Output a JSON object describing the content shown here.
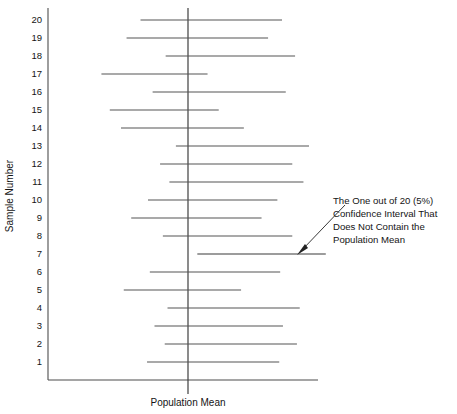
{
  "figure": {
    "type": "confidence-interval-plot",
    "background": "#ffffff",
    "line_color": "#555555",
    "axis_color": "#4d4d4d"
  },
  "axes": {
    "y_title": "Sample Number",
    "x_title": "Population Mean",
    "y_tick_labels": [
      "20",
      "19",
      "18",
      "17",
      "16",
      "15",
      "14",
      "13",
      "12",
      "11",
      "10",
      "9",
      "8",
      "7",
      "6",
      "5",
      "4",
      "3",
      "2",
      "1"
    ]
  },
  "annotation": {
    "lines": [
      "The One out of 20 (5%)",
      "Confidence Interval That",
      "Does Not Contain the",
      "Population Mean"
    ],
    "line_1": "The One out of 20 (5%)",
    "line_2": "Confidence Interval That",
    "line_3": "Does Not Contain the",
    "line_4": "Population Mean",
    "points_to_sample": 7
  },
  "chart_data": {
    "type": "line",
    "title": "",
    "xlabel": "Population Mean",
    "ylabel": "Sample Number",
    "grid": false,
    "legend": "none",
    "population_mean": 0,
    "confidence_level": "95%",
    "note": "Each horizontal segment is one sample's 95% confidence interval; the vertical line marks the true population mean. Sample 7 is the only interval that excludes the mean.",
    "categories": [
      "1",
      "2",
      "3",
      "4",
      "5",
      "6",
      "7",
      "8",
      "9",
      "10",
      "11",
      "12",
      "13",
      "14",
      "15",
      "16",
      "17",
      "18",
      "19",
      "20"
    ],
    "intervals": [
      {
        "sample": 20,
        "low": -0.51,
        "high": 1.01,
        "contains_mean": true
      },
      {
        "sample": 19,
        "low": -0.66,
        "high": 0.86,
        "contains_mean": true
      },
      {
        "sample": 18,
        "low": -0.24,
        "high": 1.15,
        "contains_mean": true
      },
      {
        "sample": 17,
        "low": -0.93,
        "high": 0.21,
        "contains_mean": true
      },
      {
        "sample": 16,
        "low": -0.38,
        "high": 1.05,
        "contains_mean": true
      },
      {
        "sample": 15,
        "low": -0.84,
        "high": 0.33,
        "contains_mean": true
      },
      {
        "sample": 14,
        "low": -0.72,
        "high": 0.6,
        "contains_mean": true
      },
      {
        "sample": 13,
        "low": -0.13,
        "high": 1.3,
        "contains_mean": true
      },
      {
        "sample": 12,
        "low": -0.3,
        "high": 1.12,
        "contains_mean": true
      },
      {
        "sample": 11,
        "low": -0.2,
        "high": 1.24,
        "contains_mean": true
      },
      {
        "sample": 10,
        "low": -0.43,
        "high": 0.96,
        "contains_mean": true
      },
      {
        "sample": 9,
        "low": -0.61,
        "high": 0.79,
        "contains_mean": true
      },
      {
        "sample": 8,
        "low": -0.27,
        "high": 1.12,
        "contains_mean": true
      },
      {
        "sample": 7,
        "low": 0.1,
        "high": 1.48,
        "contains_mean": false
      },
      {
        "sample": 6,
        "low": -0.41,
        "high": 0.99,
        "contains_mean": true
      },
      {
        "sample": 5,
        "low": -0.69,
        "high": 0.57,
        "contains_mean": true
      },
      {
        "sample": 4,
        "low": -0.22,
        "high": 1.2,
        "contains_mean": true
      },
      {
        "sample": 3,
        "low": -0.36,
        "high": 1.02,
        "contains_mean": true
      },
      {
        "sample": 2,
        "low": -0.25,
        "high": 1.17,
        "contains_mean": true
      },
      {
        "sample": 1,
        "low": -0.44,
        "high": 0.98,
        "contains_mean": true
      }
    ],
    "x_axis_range": [
      -1.15,
      1.75
    ],
    "ylim": [
      0.3,
      20.7
    ]
  },
  "geometry": {
    "plot_left": 48,
    "plot_bottom": 380,
    "plot_right": 318,
    "mean_x": 188,
    "row_top_y": 20,
    "row_bottom_y": 362
  }
}
